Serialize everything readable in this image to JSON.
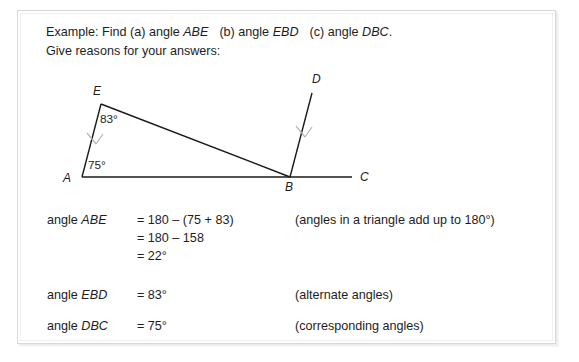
{
  "header": {
    "line1_prefix": "Example: Find (a) angle ",
    "line1_label_a": "ABE",
    "line1_mid_b": "(b) angle ",
    "line1_label_b": "EBD",
    "line1_mid_c": "(c) angle ",
    "line1_label_c": "DBC",
    "line1_suffix": ".",
    "line2": "Give reasons for your answers:"
  },
  "diagram": {
    "points": [
      {
        "name": "A",
        "label": "A",
        "x": 82,
        "y": 177,
        "label_x": 63,
        "label_y": 171
      },
      {
        "name": "E",
        "label": "E",
        "x": 101,
        "y": 104,
        "label_x": 93,
        "label_y": 84
      },
      {
        "name": "B",
        "label": "B",
        "x": 290,
        "y": 177,
        "label_x": 285,
        "label_y": 180
      },
      {
        "name": "C",
        "label": "C",
        "x": 352,
        "y": 177,
        "label_x": 360,
        "label_y": 170
      },
      {
        "name": "D",
        "label": "D",
        "x": 312,
        "y": 93,
        "label_x": 312,
        "label_y": 72
      }
    ],
    "segments": [
      {
        "name": "segment-AC",
        "from": "A",
        "to": "C"
      },
      {
        "name": "segment-AE",
        "from": "A",
        "to": "E"
      },
      {
        "name": "segment-EB",
        "from": "E",
        "to": "B"
      },
      {
        "name": "segment-BD",
        "from": "B",
        "to": "D"
      }
    ],
    "angle_labels": [
      {
        "name": "angle-at-E",
        "text": "83°",
        "x": 100,
        "y": 112
      },
      {
        "name": "angle-at-A",
        "text": "75°",
        "x": 88,
        "y": 158
      }
    ],
    "parallel_marks": [
      {
        "name": "parallel-arrow-AE",
        "x": 94,
        "y": 140
      },
      {
        "name": "parallel-arrow-BD",
        "x": 303,
        "y": 133
      }
    ],
    "line_color": "#1a1a1a",
    "mark_color": "#b5b5b5"
  },
  "solution": {
    "rows": [
      {
        "name_prefix": "angle ",
        "name_label": "ABE",
        "expr": "= 180 – (75 + 83)",
        "reason": "(angles in a triangle add up to 180°)"
      },
      {
        "name_prefix": "",
        "name_label": "",
        "expr": "= 180 – 158",
        "reason": ""
      },
      {
        "name_prefix": "",
        "name_label": "",
        "expr": "= 22°",
        "reason": ""
      },
      {
        "name_prefix": "angle ",
        "name_label": "EBD",
        "expr": "= 83°",
        "reason": "(alternate angles)"
      },
      {
        "name_prefix": "angle ",
        "name_label": "DBC",
        "expr": "= 75°",
        "reason": "(corresponding angles)"
      }
    ]
  }
}
